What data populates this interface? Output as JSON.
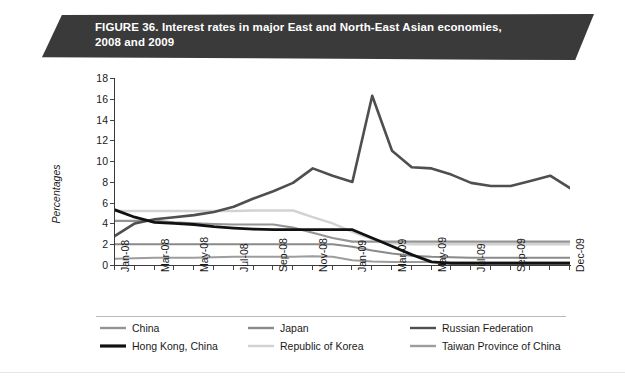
{
  "banner": {
    "figure_label": "FIGURE 36.",
    "title_line1": "Interest rates in major East and North-East Asian economies,",
    "title_line2": "2008 and 2009",
    "background_color": "#3a3a3a",
    "text_color": "#ffffff"
  },
  "chart_data": {
    "type": "line",
    "title": "FIGURE 36. Interest rates in major East and North-East Asian economies, 2008 and 2009",
    "xlabel": "",
    "ylabel": "Percentages",
    "ylim": [
      0,
      18
    ],
    "yticks": [
      0,
      2,
      4,
      6,
      8,
      10,
      12,
      14,
      16,
      18
    ],
    "grid": false,
    "legend_position": "bottom",
    "x": [
      "Jan-08",
      "Feb-08",
      "Mar-08",
      "Apr-08",
      "May-08",
      "Jun-08",
      "Jul-08",
      "Aug-08",
      "Sep-08",
      "Oct-08",
      "Nov-08",
      "Dec-08",
      "Jan-09",
      "Feb-09",
      "Mar-09",
      "Apr-09",
      "May-09",
      "Jun-09",
      "Jul-09",
      "Aug-09",
      "Sep-09",
      "Oct-09",
      "Nov-09",
      "Dec-09"
    ],
    "xtick_labels": [
      "Jan-08",
      "Mar-08",
      "May-08",
      "Jul-08",
      "Sep-08",
      "Nov-08",
      "Jan-09",
      "Mar-09",
      "May-09",
      "Jul-09",
      "Sep-09",
      "Dec-09"
    ],
    "series": [
      {
        "name": "China",
        "color": "#949494",
        "width": 2.2,
        "values": [
          4.25,
          4.25,
          4.25,
          4.1,
          4.0,
          3.95,
          3.9,
          3.9,
          3.9,
          3.6,
          3.1,
          2.6,
          2.25,
          2.25,
          2.25,
          2.25,
          2.25,
          2.25,
          2.25,
          2.25,
          2.25,
          2.25,
          2.25,
          2.25
        ]
      },
      {
        "name": "Hong Kong, China",
        "color": "#111111",
        "width": 2.8,
        "values": [
          5.3,
          4.6,
          4.1,
          4.0,
          3.9,
          3.7,
          3.55,
          3.45,
          3.4,
          3.4,
          3.4,
          3.4,
          3.4,
          2.6,
          1.8,
          1.0,
          0.3,
          0.15,
          0.15,
          0.15,
          0.15,
          0.15,
          0.15,
          0.15
        ]
      },
      {
        "name": "Japan",
        "color": "#8a8a8a",
        "width": 2.0,
        "values": [
          2.0,
          2.0,
          2.0,
          2.0,
          2.0,
          2.0,
          2.0,
          2.0,
          2.0,
          2.0,
          2.0,
          2.0,
          1.75,
          1.4,
          1.1,
          0.9,
          0.8,
          0.75,
          0.7,
          0.7,
          0.7,
          0.7,
          0.7,
          0.7
        ]
      },
      {
        "name": "Republic of Korea",
        "color": "#d2d2d2",
        "width": 2.4,
        "values": [
          5.2,
          5.2,
          5.2,
          5.2,
          5.2,
          5.2,
          5.2,
          5.25,
          5.25,
          5.25,
          4.6,
          4.0,
          3.2,
          2.5,
          2.1,
          2.0,
          2.0,
          2.0,
          2.0,
          2.0,
          2.0,
          2.0,
          2.0,
          2.0
        ]
      },
      {
        "name": "Russian Federation",
        "color": "#4f4f4f",
        "width": 2.6,
        "values": [
          2.8,
          4.0,
          4.4,
          4.6,
          4.8,
          5.1,
          5.6,
          6.4,
          7.1,
          7.9,
          9.3,
          8.6,
          8.0,
          16.3,
          11.0,
          9.4,
          9.3,
          8.7,
          7.9,
          7.6,
          7.6,
          8.1,
          8.6,
          7.4
        ]
      },
      {
        "name": "Taiwan Province of China",
        "color": "#9d9d9d",
        "width": 2.0,
        "values": [
          0.6,
          0.65,
          0.7,
          0.7,
          0.7,
          0.75,
          0.8,
          0.8,
          0.8,
          0.8,
          0.85,
          0.8,
          0.45,
          0.35,
          0.3,
          0.3,
          0.3,
          0.3,
          0.3,
          0.3,
          0.3,
          0.3,
          0.3,
          0.3
        ]
      }
    ],
    "russia_extra": {
      "note": "Russian Federation spike peaks at 16.3 in early 2009, then declines to about 5 by Dec-09",
      "values_tail": [
        8.0,
        16.3,
        10.0,
        9.0,
        8.6,
        8.2,
        7.5,
        6.9,
        6.5,
        6.4,
        6.3,
        7.0,
        6.2,
        5.3,
        5.0
      ]
    }
  },
  "legend": {
    "items": [
      {
        "label": "China",
        "color": "#949494"
      },
      {
        "label": "Hong Kong, China",
        "color": "#111111"
      },
      {
        "label": "Japan",
        "color": "#8a8a8a"
      },
      {
        "label": "Republic of Korea",
        "color": "#d2d2d2"
      },
      {
        "label": "Russian Federation",
        "color": "#4f4f4f"
      },
      {
        "label": "Taiwan Province of China",
        "color": "#9d9d9d"
      }
    ]
  }
}
